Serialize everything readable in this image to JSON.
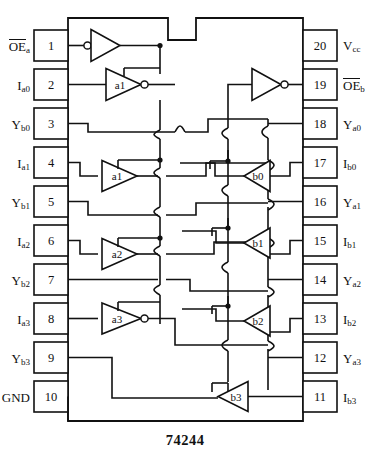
{
  "diagram": {
    "part_number": "74244",
    "type": "dip-pinout-schematic",
    "package": "20-pin DIP",
    "notch": "top-center"
  },
  "pins": {
    "left": [
      {
        "number": "1",
        "name": "OE",
        "sub": "a",
        "overbar": true
      },
      {
        "number": "2",
        "name": "I",
        "sub": "a0",
        "overbar": false
      },
      {
        "number": "3",
        "name": "Y",
        "sub": "b0",
        "overbar": false
      },
      {
        "number": "4",
        "name": "I",
        "sub": "a1",
        "overbar": false
      },
      {
        "number": "5",
        "name": "Y",
        "sub": "b1",
        "overbar": false
      },
      {
        "number": "6",
        "name": "I",
        "sub": "a2",
        "overbar": false
      },
      {
        "number": "7",
        "name": "Y",
        "sub": "b2",
        "overbar": false
      },
      {
        "number": "8",
        "name": "I",
        "sub": "a3",
        "overbar": false
      },
      {
        "number": "9",
        "name": "Y",
        "sub": "b3",
        "overbar": false
      },
      {
        "number": "10",
        "name": "GND",
        "sub": "",
        "overbar": false
      }
    ],
    "right": [
      {
        "number": "20",
        "name": "V",
        "sub": "cc",
        "overbar": false
      },
      {
        "number": "19",
        "name": "OE",
        "sub": "b",
        "overbar": true
      },
      {
        "number": "18",
        "name": "Y",
        "sub": "a0",
        "overbar": false
      },
      {
        "number": "17",
        "name": "I",
        "sub": "b0",
        "overbar": false
      },
      {
        "number": "16",
        "name": "Y",
        "sub": "a1",
        "overbar": false
      },
      {
        "number": "15",
        "name": "I",
        "sub": "b1",
        "overbar": false
      },
      {
        "number": "14",
        "name": "Y",
        "sub": "a2",
        "overbar": false
      },
      {
        "number": "13",
        "name": "I",
        "sub": "b2",
        "overbar": false
      },
      {
        "number": "12",
        "name": "Y",
        "sub": "a3",
        "overbar": false
      },
      {
        "number": "11",
        "name": "I",
        "sub": "b3",
        "overbar": false
      }
    ]
  },
  "gates": [
    {
      "id": "oea-inv",
      "label": "",
      "direction": "right",
      "bubble": "input"
    },
    {
      "id": "a0",
      "label": "a1",
      "direction": "right",
      "bubble": "output"
    },
    {
      "id": "a1",
      "label": "a1",
      "direction": "right",
      "bubble": "none"
    },
    {
      "id": "a2",
      "label": "a2",
      "direction": "right",
      "bubble": "none"
    },
    {
      "id": "a3",
      "label": "a3",
      "direction": "right",
      "bubble": "output"
    },
    {
      "id": "oeb-inv",
      "label": "",
      "direction": "right",
      "bubble": "output"
    },
    {
      "id": "b0",
      "label": "b0",
      "direction": "left",
      "bubble": "none"
    },
    {
      "id": "b1",
      "label": "b1",
      "direction": "left",
      "bubble": "none"
    },
    {
      "id": "b2",
      "label": "b2",
      "direction": "left",
      "bubble": "none"
    },
    {
      "id": "b3",
      "label": "b3",
      "direction": "left",
      "bubble": "none"
    }
  ],
  "colors": {
    "line": "#111111",
    "background": "#ffffff",
    "text": "#111111"
  }
}
